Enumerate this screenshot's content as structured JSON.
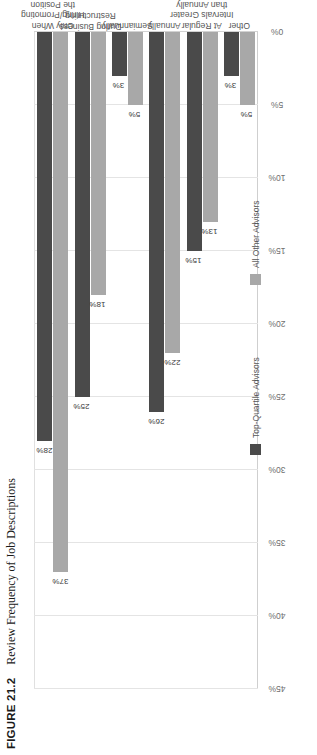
{
  "figure": {
    "number_label": "FIGURE 21.2",
    "caption": "Review Frequency of Job Descriptions"
  },
  "legend": {
    "position": "bottom",
    "entries": [
      {
        "label": "Top-Quartile Advisors",
        "color": "#4a4a4a",
        "swatch_name": "legend-swatch-top-quartile"
      },
      {
        "label": "All Other Advisors",
        "color": "#a8a8a8",
        "swatch_name": "legend-swatch-all-other"
      }
    ]
  },
  "chart_data": {
    "type": "bar",
    "orientation": "horizontal",
    "title": "Review Frequency of Job Descriptions",
    "xlabel": "",
    "ylabel": "",
    "ylim": [
      0,
      45
    ],
    "grid": true,
    "tick_labels": [
      "45%",
      "40%",
      "35%",
      "30%",
      "25%",
      "20%",
      "15%",
      "10%",
      "5%",
      "0%"
    ],
    "tick_values": [
      45,
      40,
      35,
      30,
      25,
      20,
      15,
      10,
      5,
      0
    ],
    "categories": [
      "Only When Hiring/Promoting the Position",
      "During Business Restructuring",
      "Semiannually",
      "Annually",
      "At Regular Intervals Greater than Annually",
      "Other"
    ],
    "category_lines": [
      [
        "Only When",
        "Hiring/Promoting",
        "the Position"
      ],
      [
        "During Business",
        "Restructuring"
      ],
      [
        "Semiannually"
      ],
      [
        "Annually"
      ],
      [
        "At Regular",
        "Intervals Greater",
        "than Annually"
      ],
      [
        "Other"
      ]
    ],
    "series": [
      {
        "name": "Top-Quartile Advisors",
        "color": "#4a4a4a",
        "values": [
          28,
          25,
          3,
          26,
          15,
          3
        ],
        "labels": [
          "28%",
          "25%",
          "3%",
          "26%",
          "15%",
          "3%"
        ]
      },
      {
        "name": "All Other Advisors",
        "color": "#a8a8a8",
        "values": [
          37,
          18,
          5,
          22,
          13,
          5
        ],
        "labels": [
          "37%",
          "18%",
          "5%",
          "22%",
          "13%",
          "5%"
        ]
      }
    ]
  }
}
